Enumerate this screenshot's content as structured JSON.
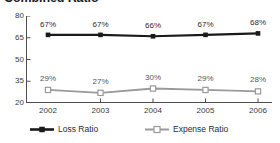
{
  "chart_data": {
    "type": "line",
    "title": "Combined Ratio",
    "xlabel": "",
    "ylabel": "",
    "categories": [
      "2002",
      "2003",
      "2004",
      "2005",
      "2006"
    ],
    "x": [
      2002,
      2003,
      2004,
      2005,
      2006
    ],
    "ylim": [
      20,
      80
    ],
    "yticks": [
      80,
      65,
      50,
      35,
      20
    ],
    "ytick_labels": [
      "80",
      "65",
      "50",
      "35",
      "20"
    ],
    "grid": false,
    "legend_position": "bottom",
    "series": [
      {
        "name": "Loss Ratio",
        "values": [
          67,
          67,
          66,
          67,
          68
        ],
        "point_labels": [
          "67%",
          "67%",
          "66%",
          "67%",
          "68%"
        ],
        "color": "#1a1a1a",
        "marker": "filled-square"
      },
      {
        "name": "Expense Ratio",
        "values": [
          29,
          27,
          30,
          29,
          28
        ],
        "point_labels": [
          "29%",
          "27%",
          "30%",
          "29%",
          "28%"
        ],
        "color": "#9a9a9a",
        "marker": "open-square"
      }
    ]
  },
  "legend": {
    "items": [
      {
        "label": "Loss Ratio",
        "swatch": "loss-ratio-swatch-icon"
      },
      {
        "label": "Expense Ratio",
        "swatch": "expense-ratio-swatch-icon"
      }
    ]
  },
  "colors": {
    "loss_ratio": "#1a1a1a",
    "expense_ratio": "#9a9a9a",
    "axis": "#4d4d4d",
    "text": "#2b2b2b",
    "background": "#ffffff"
  }
}
